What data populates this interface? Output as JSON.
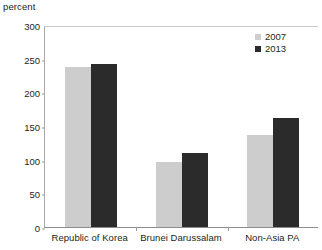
{
  "chart_data": {
    "type": "bar",
    "title": "",
    "subtitle": "",
    "xlabel": "",
    "ylabel": "percent",
    "ylim": [
      0,
      300
    ],
    "yticks": [
      0,
      50,
      100,
      150,
      200,
      250,
      300
    ],
    "ytick_labels": [
      "0",
      "50",
      "100",
      "150",
      "200",
      "250",
      "300"
    ],
    "grid": false,
    "legend_position": "top-right",
    "categories": [
      "Republic of Korea",
      "Brunei Darussalam",
      "Non-Asia PA"
    ],
    "series": [
      {
        "name": "2007",
        "color": "#cdcdcd",
        "values": [
          237,
          96,
          136
        ]
      },
      {
        "name": "2013",
        "color": "#2b2b2b",
        "values": [
          242,
          110,
          162
        ]
      }
    ]
  },
  "legend": {
    "items": [
      {
        "label": "2007",
        "color": "#cdcdcd"
      },
      {
        "label": "2013",
        "color": "#2b2b2b"
      }
    ]
  }
}
